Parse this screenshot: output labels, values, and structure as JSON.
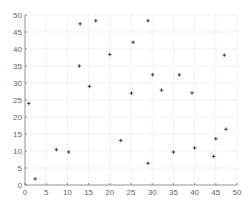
{
  "chart_data": {
    "type": "scatter",
    "title": "",
    "xlabel": "",
    "ylabel": "",
    "xlim": [
      0,
      50
    ],
    "ylim": [
      0,
      50
    ],
    "grid": true,
    "legend": null,
    "marker": "+",
    "x_ticks": [
      0,
      5,
      10,
      15,
      20,
      25,
      30,
      35,
      40,
      45,
      50
    ],
    "y_ticks": [
      0,
      5,
      10,
      15,
      20,
      25,
      30,
      35,
      40,
      45,
      50
    ],
    "series": [
      {
        "name": "points",
        "color": "#333333",
        "points": [
          {
            "x": 0.9,
            "y": 24.0
          },
          {
            "x": 2.4,
            "y": 1.8
          },
          {
            "x": 7.4,
            "y": 10.4
          },
          {
            "x": 10.3,
            "y": 9.7
          },
          {
            "x": 12.8,
            "y": 35.0
          },
          {
            "x": 13.0,
            "y": 47.4
          },
          {
            "x": 15.2,
            "y": 29.0
          },
          {
            "x": 16.7,
            "y": 48.3
          },
          {
            "x": 20.0,
            "y": 38.4
          },
          {
            "x": 22.6,
            "y": 13.1
          },
          {
            "x": 25.1,
            "y": 27.0
          },
          {
            "x": 25.5,
            "y": 42.0
          },
          {
            "x": 29.0,
            "y": 48.3
          },
          {
            "x": 29.0,
            "y": 6.4
          },
          {
            "x": 30.1,
            "y": 32.4
          },
          {
            "x": 32.2,
            "y": 27.9
          },
          {
            "x": 35.0,
            "y": 9.7
          },
          {
            "x": 36.4,
            "y": 32.4
          },
          {
            "x": 39.4,
            "y": 27.1
          },
          {
            "x": 40.0,
            "y": 10.9
          },
          {
            "x": 44.5,
            "y": 8.4
          },
          {
            "x": 45.0,
            "y": 13.6
          },
          {
            "x": 47.0,
            "y": 38.2
          },
          {
            "x": 47.4,
            "y": 16.4
          }
        ]
      }
    ]
  }
}
